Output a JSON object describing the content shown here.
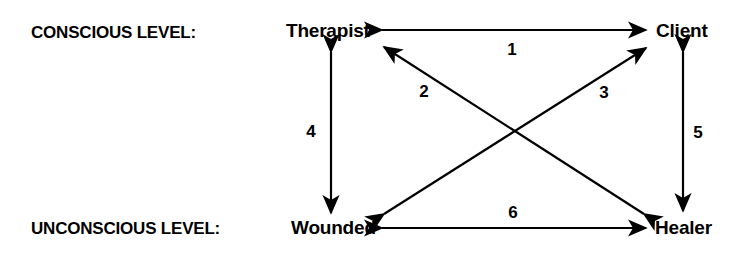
{
  "diagram": {
    "type": "node-edge-diagram",
    "colors": {
      "background": "#ffffff",
      "stroke": "#000000",
      "text": "#000000"
    },
    "levels": [
      {
        "id": "conscious",
        "label": "CONSCIOUS LEVEL:"
      },
      {
        "id": "unconscious",
        "label": "UNCONSCIOUS LEVEL:"
      }
    ],
    "nodes": [
      {
        "id": "therapist",
        "label": "Therapist",
        "level": "conscious",
        "position": "top-left"
      },
      {
        "id": "client",
        "label": "Client",
        "level": "conscious",
        "position": "top-right"
      },
      {
        "id": "wounded",
        "label": "Wounded",
        "level": "unconscious",
        "position": "bottom-left"
      },
      {
        "id": "healer",
        "label": "Healer",
        "level": "unconscious",
        "position": "bottom-right"
      }
    ],
    "edges": [
      {
        "id": 1,
        "label": "1",
        "from": "therapist",
        "to": "client",
        "direction": "bidirectional",
        "orientation": "horizontal-top"
      },
      {
        "id": 2,
        "label": "2",
        "from": "healer",
        "to": "therapist",
        "direction": "bidirectional",
        "orientation": "diagonal-rising"
      },
      {
        "id": 3,
        "label": "3",
        "from": "wounded",
        "to": "client",
        "direction": "bidirectional",
        "orientation": "diagonal-rising"
      },
      {
        "id": 4,
        "label": "4",
        "from": "therapist",
        "to": "wounded",
        "direction": "bidirectional",
        "orientation": "vertical-left"
      },
      {
        "id": 5,
        "label": "5",
        "from": "client",
        "to": "healer",
        "direction": "bidirectional",
        "orientation": "vertical-right"
      },
      {
        "id": 6,
        "label": "6",
        "from": "wounded",
        "to": "healer",
        "direction": "bidirectional",
        "orientation": "horizontal-bottom"
      }
    ]
  }
}
